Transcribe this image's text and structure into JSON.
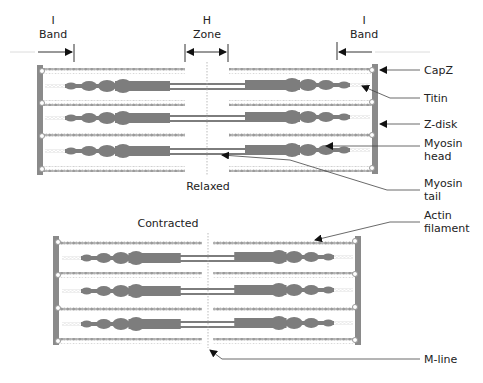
{
  "top_labels": {
    "i_band_left": [
      "I",
      "Band"
    ],
    "h_zone": [
      "H",
      "Zone"
    ],
    "i_band_right": [
      "I",
      "Band"
    ]
  },
  "state_labels": {
    "relaxed": "Relaxed",
    "contracted": "Contracted"
  },
  "callouts": [
    {
      "id": "capz",
      "lines": [
        "CapZ"
      ]
    },
    {
      "id": "titin",
      "lines": [
        "Titin"
      ]
    },
    {
      "id": "z-disk",
      "lines": [
        "Z-disk"
      ]
    },
    {
      "id": "myosin-head",
      "lines": [
        "Myosin",
        "head"
      ]
    },
    {
      "id": "myosin-tail",
      "lines": [
        "Myosin",
        "tail"
      ]
    },
    {
      "id": "actin-filament",
      "lines": [
        "Actin",
        "filament"
      ]
    },
    {
      "id": "m-line",
      "lines": [
        "M-line"
      ]
    }
  ],
  "colors": {
    "z_disk": "#8a8a8a",
    "myosin": "#7d7d7d",
    "actin": "#9a9a9a",
    "titin": "#c8c8c8",
    "line": "#555555",
    "text": "#222222"
  }
}
